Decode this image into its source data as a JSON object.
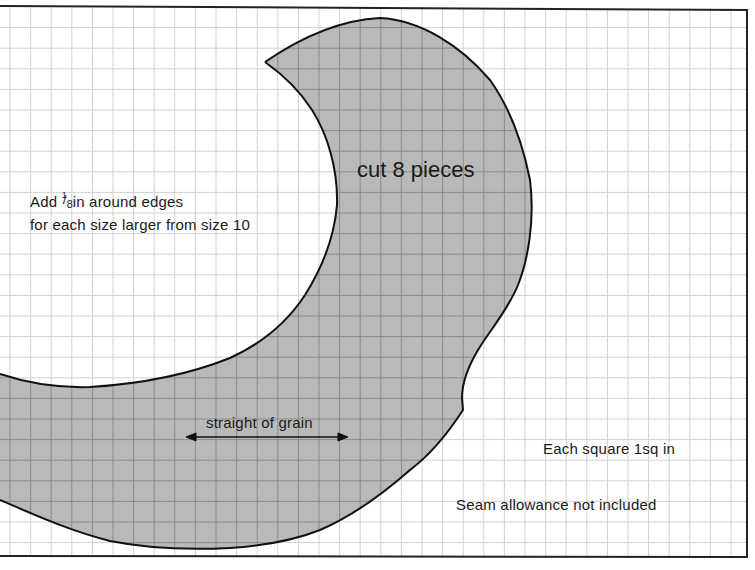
{
  "pattern": {
    "piece_label": "cut 8 pieces",
    "grain_label": "straight of grain",
    "size_note": {
      "line1_prefix": "Add",
      "fraction_numerator": "1",
      "fraction_denominator": "8",
      "line1_suffix": "in around edges",
      "line2": "for each size larger from size 10"
    },
    "scale_note": "Each square 1sq in",
    "seam_note": "Seam allowance not included"
  },
  "colors": {
    "background": "#ffffff",
    "grid_light": "#d2d2d2",
    "grid_dark": "#8c8c8c",
    "piece_fill": "#b9b9b9",
    "outline": "#111111",
    "text": "#1a1a1a"
  },
  "grid": {
    "spacing_px": 20.6,
    "offset_x": 10,
    "offset_y": 7
  }
}
